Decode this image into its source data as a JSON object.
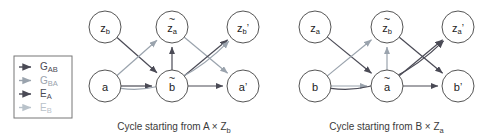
{
  "legend": {
    "items": [
      {
        "label": "G",
        "subscript": "AB",
        "color": "#4a4a55",
        "name": "legend-item-gab"
      },
      {
        "label": "G",
        "subscript": "BA",
        "color": "#9aa3ad",
        "name": "legend-item-gba"
      },
      {
        "label": "E",
        "subscript": "A",
        "color": "#4a4a55",
        "name": "legend-item-ea"
      },
      {
        "label": "E",
        "subscript": "B",
        "color": "#b9c2ca",
        "name": "legend-item-eb"
      }
    ]
  },
  "diagrams": [
    {
      "id": "left",
      "caption": "Cycle starting from A × Z",
      "caption_subscript": "b",
      "nodes": [
        {
          "name": "node-zb",
          "base": "z",
          "sub": "b",
          "tilde": false,
          "prime": false,
          "cx": 105,
          "cy": 27
        },
        {
          "name": "node-za-tilde",
          "base": "z",
          "sub": "a",
          "tilde": true,
          "prime": false,
          "cx": 172,
          "cy": 27
        },
        {
          "name": "node-zb-prime",
          "base": "z",
          "sub": "b",
          "tilde": false,
          "prime": true,
          "cx": 243,
          "cy": 27
        },
        {
          "name": "node-a",
          "base": "a",
          "sub": "",
          "tilde": false,
          "prime": false,
          "cx": 105,
          "cy": 86
        },
        {
          "name": "node-b-tilde",
          "base": "b",
          "sub": "",
          "tilde": true,
          "prime": false,
          "cx": 172,
          "cy": 86
        },
        {
          "name": "node-a-prime",
          "base": "a",
          "sub": "",
          "tilde": false,
          "prime": true,
          "cx": 243,
          "cy": 86
        }
      ],
      "edges": [
        {
          "name": "edge-zb-to-b-tilde",
          "from": "node-zb",
          "to": "node-b-tilde",
          "color": "#4a4a55",
          "curve": 0
        },
        {
          "name": "edge-a-to-za-tilde",
          "from": "node-a",
          "to": "node-za-tilde",
          "color": "#9aa3ad",
          "curve": 0
        },
        {
          "name": "edge-a-to-b-tilde",
          "from": "node-a",
          "to": "node-b-tilde",
          "color": "#4a4a55",
          "curve": 0
        },
        {
          "name": "edge-b-tilde-to-za-tilde",
          "from": "node-b-tilde",
          "to": "node-za-tilde",
          "color": "#4a4a55",
          "curve": 0
        },
        {
          "name": "edge-za-tilde-to-a-prime",
          "from": "node-za-tilde",
          "to": "node-a-prime",
          "color": "#9aa3ad",
          "curve": 0
        },
        {
          "name": "edge-b-tilde-to-a-prime",
          "from": "node-b-tilde",
          "to": "node-a-prime",
          "color": "#4a4a55",
          "curve": 0
        },
        {
          "name": "edge-b-tilde-to-zb-prime",
          "from": "node-b-tilde",
          "to": "node-zb-prime",
          "color": "#4a4a55",
          "curve": 0
        },
        {
          "name": "edge-a-to-zb-prime",
          "from": "node-a",
          "to": "node-zb-prime",
          "color": "#9aa3ad",
          "curve": 40
        }
      ]
    },
    {
      "id": "right",
      "caption": "Cycle starting from B × Z",
      "caption_subscript": "a",
      "nodes": [
        {
          "name": "node-za",
          "base": "z",
          "sub": "a",
          "tilde": false,
          "prime": false,
          "cx": 315,
          "cy": 27
        },
        {
          "name": "node-zb-tilde",
          "base": "z",
          "sub": "b",
          "tilde": true,
          "prime": false,
          "cx": 387,
          "cy": 27
        },
        {
          "name": "node-za-prime",
          "base": "z",
          "sub": "a",
          "tilde": false,
          "prime": true,
          "cx": 458,
          "cy": 27
        },
        {
          "name": "node-b",
          "base": "b",
          "sub": "",
          "tilde": false,
          "prime": false,
          "cx": 315,
          "cy": 86
        },
        {
          "name": "node-a-tilde",
          "base": "a",
          "sub": "",
          "tilde": true,
          "prime": false,
          "cx": 387,
          "cy": 86
        },
        {
          "name": "node-b-prime",
          "base": "b",
          "sub": "",
          "tilde": false,
          "prime": true,
          "cx": 458,
          "cy": 86
        }
      ],
      "edges": [
        {
          "name": "edge-za-to-a-tilde",
          "from": "node-za",
          "to": "node-a-tilde",
          "color": "#4a4a55",
          "curve": 0
        },
        {
          "name": "edge-b-to-zb-tilde",
          "from": "node-b",
          "to": "node-zb-tilde",
          "color": "#9aa3ad",
          "curve": 0
        },
        {
          "name": "edge-b-to-a-tilde",
          "from": "node-b",
          "to": "node-a-tilde",
          "color": "#9aa3ad",
          "curve": 0
        },
        {
          "name": "edge-a-tilde-to-zb-tilde",
          "from": "node-a-tilde",
          "to": "node-zb-tilde",
          "color": "#9aa3ad",
          "curve": 0
        },
        {
          "name": "edge-zb-tilde-to-b-prime",
          "from": "node-zb-tilde",
          "to": "node-b-prime",
          "color": "#4a4a55",
          "curve": 0
        },
        {
          "name": "edge-a-tilde-to-b-prime",
          "from": "node-a-tilde",
          "to": "node-b-prime",
          "color": "#4a4a55",
          "curve": 0
        },
        {
          "name": "edge-a-tilde-to-za-prime",
          "from": "node-a-tilde",
          "to": "node-za-prime",
          "color": "#4a4a55",
          "curve": 0
        },
        {
          "name": "edge-b-to-za-prime",
          "from": "node-b",
          "to": "node-za-prime",
          "color": "#4a4a55",
          "curve": 40
        }
      ]
    }
  ]
}
